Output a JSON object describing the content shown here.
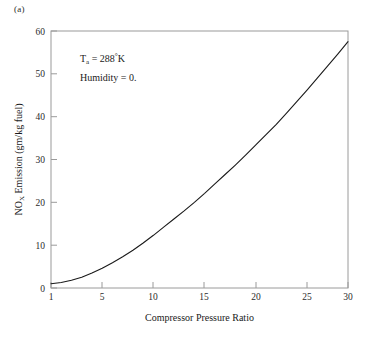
{
  "panel": {
    "label": "(a)"
  },
  "chart_data": {
    "type": "line",
    "title": "",
    "subtitle": "",
    "xlabel": "Compressor Pressure Ratio",
    "ylabel": "NO_X Emission (gm/kg fuel)",
    "ylabel_parts": {
      "lead": "NO",
      "sub": "X",
      "tail": " Emission (gm/kg fuel)"
    },
    "xlim": [
      1,
      30
    ],
    "ylim": [
      0,
      60
    ],
    "xticks": [
      1,
      5,
      10,
      15,
      20,
      25,
      30
    ],
    "xtick_labels": [
      "1",
      "5",
      "10",
      "15",
      "20",
      "25",
      "30"
    ],
    "yticks": [
      0,
      10,
      20,
      30,
      40,
      50,
      60
    ],
    "ytick_labels": [
      "0",
      "10",
      "20",
      "30",
      "40",
      "50",
      "60"
    ],
    "grid": false,
    "legend": null,
    "legend_position": "none",
    "line_color": "#1a1a1a",
    "frame_color": "#9a9a9a",
    "series": [
      {
        "name": "NOx Emission",
        "x": [
          1,
          2,
          3,
          4,
          5,
          6,
          7,
          8,
          9,
          10,
          11,
          12,
          13,
          14,
          15,
          16,
          17,
          18,
          19,
          20,
          21,
          22,
          23,
          24,
          25,
          26,
          27,
          28,
          29,
          30
        ],
        "values": [
          1.0,
          1.3,
          1.8,
          2.5,
          3.5,
          4.6,
          5.9,
          7.3,
          8.8,
          10.5,
          12.3,
          14.2,
          16.1,
          18.0,
          20.0,
          22.1,
          24.3,
          26.5,
          28.7,
          31.0,
          33.4,
          35.8,
          38.2,
          40.8,
          43.5,
          46.2,
          49.0,
          51.8,
          54.6,
          57.5
        ]
      }
    ],
    "annotations": [
      {
        "name": "ambient-temperature",
        "text": "T_a = 288°K",
        "parts": {
          "lead": "T",
          "sub": "a",
          "tail": " = 288",
          "deg": "°",
          "unit": "K"
        },
        "x_data": 4.2,
        "y_data": 52.5
      },
      {
        "name": "humidity",
        "text": "Humidity = 0.",
        "x_data": 4.2,
        "y_data": 47.0
      }
    ]
  }
}
